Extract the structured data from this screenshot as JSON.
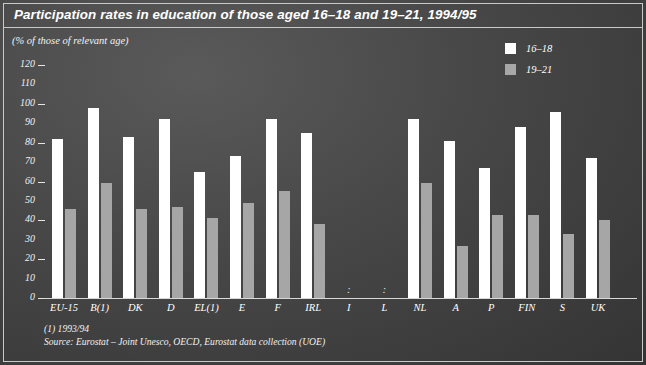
{
  "header": {
    "title": "Participation rates in education of those aged 16–18 and 19–21, 1994/95",
    "subtitle": "(% of those of relevant age)"
  },
  "legend": {
    "position": "top-right",
    "items": [
      {
        "label": "16–18",
        "swatch": "white",
        "color": "#ffffff"
      },
      {
        "label": "19–21",
        "swatch": "gray",
        "color": "#a6a6a6"
      }
    ]
  },
  "footnotes": [
    "(1)  1993/94",
    "Source: Eurostat – Joint Unesco, OECD, Eurostat data collection (UOE)"
  ],
  "missing_marker": ":",
  "colors": {
    "background": "#474747",
    "series_16_18": "#ffffff",
    "series_19_21": "#a6a6a6",
    "axis": "#d8d8d8",
    "text": "#ffffff"
  },
  "chart_data": {
    "type": "bar",
    "title": "Participation rates in education of those aged 16–18 and 19–21, 1994/95",
    "subtitle": "(% of those of relevant age)",
    "xlabel": "",
    "ylabel": "(% of those of relevant age)",
    "ylim": [
      0,
      120
    ],
    "ytick_step": 10,
    "yticks": [
      0,
      10,
      20,
      30,
      40,
      50,
      60,
      70,
      80,
      90,
      100,
      110,
      120
    ],
    "ytick_dashes": [
      0,
      20,
      40,
      60,
      80,
      100,
      120
    ],
    "grid": false,
    "legend_position": "top-right",
    "categories": [
      "EU-15",
      "B(1)",
      "DK",
      "D",
      "EL(1)",
      "E",
      "F",
      "IRL",
      "I",
      "L",
      "NL",
      "A",
      "P",
      "FIN",
      "S",
      "UK"
    ],
    "series": [
      {
        "name": "16–18",
        "color": "#ffffff",
        "values": [
          82,
          98,
          83,
          92,
          65,
          73,
          92,
          85,
          null,
          null,
          92,
          81,
          67,
          88,
          96,
          72
        ]
      },
      {
        "name": "19–21",
        "color": "#a6a6a6",
        "values": [
          46,
          59,
          46,
          47,
          41,
          49,
          55,
          38,
          null,
          null,
          59,
          27,
          43,
          43,
          33,
          40
        ]
      }
    ]
  }
}
